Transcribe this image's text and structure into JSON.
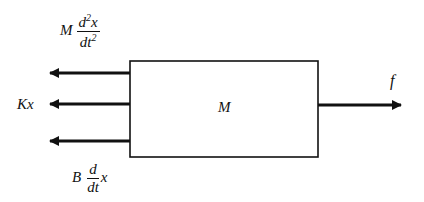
{
  "diagram": {
    "type": "free-body diagram",
    "block": {
      "label": "M"
    },
    "forces_left": [
      {
        "id": "inertial",
        "coef": "M",
        "num": "d",
        "num_sup": "2",
        "num_var": "x",
        "den": "dt",
        "den_sup": "2"
      },
      {
        "id": "spring",
        "text": "Kx"
      },
      {
        "id": "damper",
        "coef": "B",
        "num": "d",
        "den": "dt",
        "tail": "x"
      }
    ],
    "force_right": {
      "id": "applied",
      "label": "f"
    },
    "colors": {
      "stroke": "#111111",
      "background": "#ffffff"
    }
  }
}
